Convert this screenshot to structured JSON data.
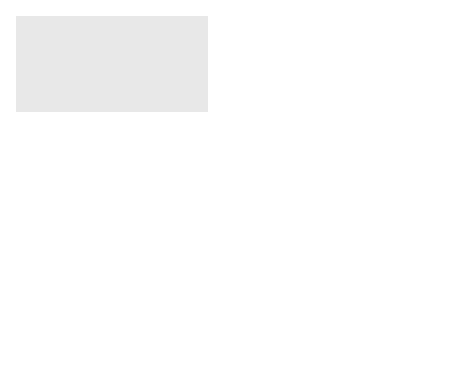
{
  "diagram": {
    "colors": {
      "extracellular_bg": "#e6e6e6",
      "cytosol_fill": "#c8c8c8",
      "membrane": "#9a9a9a",
      "vesicle_fill": "#8c8c8c",
      "lysosome_fill": "#b4b4b4",
      "particle": "#7e7e7e",
      "arrow": "#111111"
    },
    "labels": {
      "extracellular_line1": "Extracellular",
      "extracellular_line2": "fluid",
      "cytosol": "Cytosol",
      "plasma_membrane_line1": "Plasma",
      "plasma_membrane_line2": "membrane",
      "vesicle": "Vesicle",
      "lysosome": "Lysosome",
      "release_line1": "Release of",
      "release_line2": "contents to",
      "release_line3": "cytosol",
      "ingested_line1": "Ingested",
      "ingested_line2": "substance",
      "detached_vesicle": "Detached vesicle",
      "pit": "Pit"
    },
    "steps": [
      {
        "number": "1",
        "lines": [
          "Vesicle fusing",
          "with lysosome",
          "for digestion"
        ]
      },
      {
        "number": "2",
        "lines": [
          "Transport to plasma",
          "membrane and exocytosis",
          "of vesicle contents"
        ]
      },
      {
        "number": "3",
        "lines": [
          "Membranes and receptors",
          "(if present) recycled to plasma",
          "membrane"
        ]
      }
    ]
  }
}
